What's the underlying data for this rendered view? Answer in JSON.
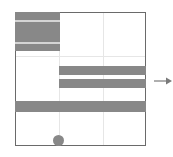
{
  "diagram": {
    "type": "grid-layout-diagram",
    "colors": {
      "fill": "#888888",
      "border": "#6a6a6a",
      "gridline": "#e6e6e6",
      "stripe": "#d4d4d4",
      "arrow": "#7a7a7a"
    },
    "frame": {
      "x": 15,
      "y": 12,
      "width": 131,
      "height": 134
    },
    "gridlines": {
      "vertical_x": [
        59,
        103
      ],
      "horizontal_y": [
        56,
        101
      ]
    },
    "blocks": [
      {
        "id": "top-left-block",
        "x": 15,
        "y": 12,
        "width": 44,
        "height": 38,
        "stripes_y": [
          20,
          42
        ]
      },
      {
        "id": "middle-bar-1",
        "x": 59,
        "y": 66,
        "width": 87,
        "height": 9
      },
      {
        "id": "middle-bar-2",
        "x": 59,
        "y": 79,
        "width": 87,
        "height": 9
      },
      {
        "id": "wide-bar",
        "x": 15,
        "y": 101,
        "width": 131,
        "height": 11
      }
    ],
    "marker": {
      "id": "circle-marker",
      "cx": 58,
      "cy": 140,
      "r": 5
    },
    "arrow": {
      "direction": "right",
      "x1": 155,
      "x2": 171,
      "y": 81
    }
  }
}
